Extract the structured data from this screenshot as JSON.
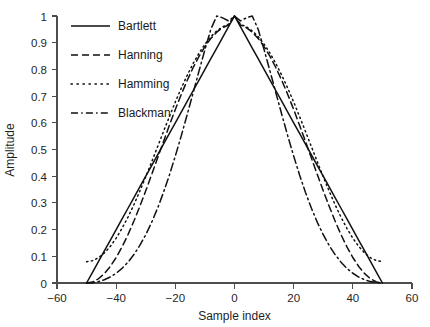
{
  "chart_data": {
    "type": "line",
    "title": "",
    "subtitle": "",
    "xlabel": "Sample index",
    "ylabel": "Amplitude",
    "xlim": [
      -60,
      60
    ],
    "ylim": [
      0,
      1
    ],
    "xticks": [
      "−60",
      "−40",
      "−20",
      "0",
      "20",
      "40",
      "60"
    ],
    "xtick_values": [
      -60,
      -40,
      -20,
      0,
      20,
      40,
      60
    ],
    "yticks": [
      "0",
      "0.1",
      "0.2",
      "0.3",
      "0.4",
      "0.5",
      "0.6",
      "0.7",
      "0.8",
      "0.9",
      "1"
    ],
    "ytick_values": [
      0,
      0.1,
      0.2,
      0.3,
      0.4,
      0.5,
      0.6,
      0.7,
      0.8,
      0.9,
      1
    ],
    "grid": false,
    "legend_position": "upper-left-inside",
    "window_length": 101,
    "half_width": 50,
    "x": [
      -50,
      -48,
      -46,
      -44,
      -42,
      -40,
      -38,
      -36,
      -34,
      -32,
      -30,
      -28,
      -26,
      -24,
      -22,
      -20,
      -18,
      -16,
      -14,
      -12,
      -10,
      -8,
      -6,
      -4,
      -2,
      0,
      2,
      4,
      6,
      8,
      10,
      12,
      14,
      16,
      18,
      20,
      22,
      24,
      26,
      28,
      30,
      32,
      34,
      36,
      38,
      40,
      42,
      44,
      46,
      48,
      50
    ],
    "series": [
      {
        "name": "Bartlett",
        "linestyle": "solid",
        "color": "#111111",
        "values": [
          0,
          0.04,
          0.08,
          0.12,
          0.16,
          0.2,
          0.24,
          0.28,
          0.32,
          0.36,
          0.4,
          0.44,
          0.48,
          0.52,
          0.56,
          0.6,
          0.64,
          0.68,
          0.72,
          0.76,
          0.8,
          0.84,
          0.88,
          0.92,
          0.96,
          1,
          0.96,
          0.92,
          0.88,
          0.84,
          0.8,
          0.76,
          0.72,
          0.68,
          0.64,
          0.6,
          0.56,
          0.52,
          0.48,
          0.44,
          0.4,
          0.36,
          0.32,
          0.28,
          0.24,
          0.2,
          0.16,
          0.12,
          0.08,
          0.04,
          0
        ]
      },
      {
        "name": "Hanning",
        "linestyle": "dashed",
        "color": "#111111",
        "values": [
          0,
          0.0039,
          0.0157,
          0.0351,
          0.0618,
          0.0955,
          0.1355,
          0.1812,
          0.2321,
          0.2872,
          0.3455,
          0.4061,
          0.4679,
          0.5298,
          0.5908,
          0.65,
          0.7061,
          0.7584,
          0.8061,
          0.8486,
          0.8853,
          0.9156,
          0.9394,
          0.9563,
          0.9663,
          1,
          0.9663,
          0.9563,
          0.9394,
          0.9156,
          0.8853,
          0.8486,
          0.8061,
          0.7584,
          0.7061,
          0.65,
          0.5908,
          0.5298,
          0.4679,
          0.4061,
          0.3455,
          0.2872,
          0.2321,
          0.1812,
          0.1355,
          0.0955,
          0.0618,
          0.0351,
          0.0157,
          0.0039,
          0
        ]
      },
      {
        "name": "Hamming",
        "linestyle": "dotted",
        "color": "#111111",
        "values": [
          0.08,
          0.0836,
          0.0944,
          0.1123,
          0.1369,
          0.1679,
          0.2047,
          0.2467,
          0.2935,
          0.3442,
          0.3978,
          0.4536,
          0.5105,
          0.5674,
          0.6235,
          0.678,
          0.7296,
          0.7777,
          0.8216,
          0.8607,
          0.8944,
          0.9224,
          0.9443,
          0.9598,
          0.969,
          1,
          0.969,
          0.9598,
          0.9443,
          0.9224,
          0.8944,
          0.8607,
          0.8216,
          0.7777,
          0.7296,
          0.678,
          0.6235,
          0.5674,
          0.5105,
          0.4536,
          0.3978,
          0.3442,
          0.2935,
          0.2467,
          0.2047,
          0.1679,
          0.1369,
          0.1123,
          0.0944,
          0.0836,
          0.08
        ]
      },
      {
        "name": "Blackman",
        "linestyle": "dashdot",
        "color": "#111111",
        "values": [
          0,
          0.0013,
          0.0052,
          0.0121,
          0.0224,
          0.0365,
          0.0549,
          0.0781,
          0.1065,
          0.1406,
          0.1808,
          0.2272,
          0.2801,
          0.3393,
          0.4046,
          0.4755,
          0.5511,
          0.6304,
          0.7118,
          0.7937,
          0.874,
          0.9502,
          1.0,
          0.993,
          0.9815,
          1,
          0.9815,
          0.993,
          1.0,
          0.9502,
          0.874,
          0.7937,
          0.7118,
          0.6304,
          0.5511,
          0.4755,
          0.4046,
          0.3393,
          0.2801,
          0.2272,
          0.1808,
          0.1406,
          0.1065,
          0.0781,
          0.0549,
          0.0365,
          0.0224,
          0.0121,
          0.0052,
          0.0013,
          0
        ]
      }
    ],
    "legend": [
      {
        "label": "Bartlett",
        "linestyle": "solid"
      },
      {
        "label": "Hanning",
        "linestyle": "dashed"
      },
      {
        "label": "Hamming",
        "linestyle": "dotted"
      },
      {
        "label": "Blackman",
        "linestyle": "dashdot"
      }
    ]
  },
  "axes": {
    "ylabel": "Amplitude",
    "xlabel": "Sample index",
    "ytick_labels": [
      "1",
      "0.9",
      "0.8",
      "0.7",
      "0.6",
      "0.5",
      "0.4",
      "0.3",
      "0.2",
      "0.1",
      "0"
    ],
    "xtick_labels": [
      "−60",
      "−40",
      "−20",
      "0",
      "20",
      "40",
      "60"
    ]
  },
  "legend": {
    "items": [
      {
        "label": "Bartlett"
      },
      {
        "label": "Hanning"
      },
      {
        "label": "Hamming"
      },
      {
        "label": "Blackman"
      }
    ]
  }
}
